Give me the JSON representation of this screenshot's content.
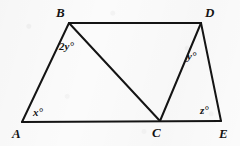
{
  "figure": {
    "background_color": "#fbfbfb",
    "stroke_color": "#141414",
    "stroke_width": 2,
    "vertices": [
      {
        "name": "A",
        "label": "A",
        "x": 22,
        "y": 122,
        "label_x": 12,
        "label_y": 127
      },
      {
        "name": "B",
        "label": "B",
        "x": 69,
        "y": 23,
        "label_x": 56,
        "label_y": 6
      },
      {
        "name": "C",
        "label": "C",
        "x": 160,
        "y": 121,
        "label_x": 152,
        "label_y": 126
      },
      {
        "name": "D",
        "label": "D",
        "x": 201,
        "y": 23,
        "label_x": 205,
        "label_y": 6
      },
      {
        "name": "E",
        "label": "E",
        "x": 221,
        "y": 121,
        "label_x": 219,
        "label_y": 127
      }
    ],
    "segments": [
      {
        "name": "segment-AB",
        "from": "A",
        "to": "B"
      },
      {
        "name": "segment-BD",
        "from": "B",
        "to": "D"
      },
      {
        "name": "segment-DE",
        "from": "D",
        "to": "E"
      },
      {
        "name": "segment-AE",
        "from": "A",
        "to": "E"
      },
      {
        "name": "segment-BC",
        "from": "B",
        "to": "C"
      },
      {
        "name": "segment-CD",
        "from": "C",
        "to": "D"
      }
    ],
    "angle_labels": [
      {
        "name": "angle-x",
        "text": "x°",
        "at_vertex": "A",
        "x": 33,
        "y": 107
      },
      {
        "name": "angle-2y",
        "text": "2y°",
        "at_vertex": "B",
        "x": 59,
        "y": 41
      },
      {
        "name": "angle-y",
        "text": "y°",
        "at_vertex": "D",
        "x": 187,
        "y": 51
      },
      {
        "name": "angle-z",
        "text": "z°",
        "at_vertex": "E",
        "x": 200,
        "y": 105
      }
    ]
  }
}
